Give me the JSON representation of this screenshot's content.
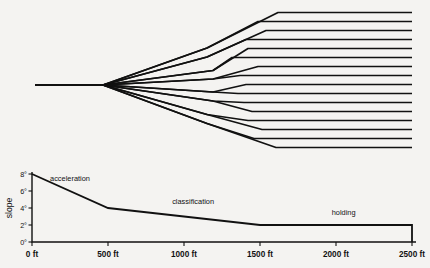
{
  "figure": {
    "background_color": "#f4f3f1",
    "line_color": "#111111"
  },
  "yard_diagram": {
    "name": "classification-yard-fan",
    "description": "Single entry track fanning out through a binary tree of switches into 16 parallel classification tracks",
    "entry_track_count": 1,
    "classification_track_count": 16,
    "switch_levels": 4,
    "stem": {
      "x_start": 35,
      "x_end": 103,
      "y": 85
    },
    "fan_start_x": 103,
    "fan_end_x": 412,
    "tracks": [
      {
        "index": 1,
        "y_end": 12.5,
        "lead_x": 278,
        "parent_y": 48.0,
        "split_x": 207
      },
      {
        "index": 2,
        "y_end": 21.5,
        "lead_x": 258,
        "parent_y": 48.0,
        "split_x": 207
      },
      {
        "index": 3,
        "y_end": 30.5,
        "lead_x": 266,
        "parent_y": 57.0,
        "split_x": 207
      },
      {
        "index": 4,
        "y_end": 39.5,
        "lead_x": 246,
        "parent_y": 57.0,
        "split_x": 207
      },
      {
        "index": 5,
        "y_end": 48.5,
        "lead_x": 248,
        "parent_y": 70.5,
        "split_x": 213
      },
      {
        "index": 6,
        "y_end": 57.5,
        "lead_x": 232,
        "parent_y": 70.5,
        "split_x": 213
      },
      {
        "index": 7,
        "y_end": 66.5,
        "lead_x": 258,
        "parent_y": 79.0,
        "split_x": 213
      },
      {
        "index": 8,
        "y_end": 75.5,
        "lead_x": 240,
        "parent_y": 79.0,
        "split_x": 213
      },
      {
        "index": 9,
        "y_end": 84.5,
        "lead_x": 246,
        "parent_y": 92.0,
        "split_x": 213
      },
      {
        "index": 10,
        "y_end": 93.5,
        "lead_x": 238,
        "parent_y": 92.0,
        "split_x": 213
      },
      {
        "index": 11,
        "y_end": 102.5,
        "lead_x": 244,
        "parent_y": 101.0,
        "split_x": 213
      },
      {
        "index": 12,
        "y_end": 111.5,
        "lead_x": 252,
        "parent_y": 101.0,
        "split_x": 213
      },
      {
        "index": 13,
        "y_end": 120.5,
        "lead_x": 248,
        "parent_y": 114.5,
        "split_x": 207
      },
      {
        "index": 14,
        "y_end": 129.5,
        "lead_x": 262,
        "parent_y": 114.5,
        "split_x": 207
      },
      {
        "index": 15,
        "y_end": 138.5,
        "lead_x": 254,
        "parent_y": 123.5,
        "split_x": 207
      },
      {
        "index": 16,
        "y_end": 147.5,
        "lead_x": 276,
        "parent_y": 123.5,
        "split_x": 207
      }
    ]
  },
  "chart_data": {
    "type": "line",
    "name": "grade-profile",
    "title": "",
    "xlabel": "",
    "ylabel": "slope",
    "x": [
      0,
      500,
      1500,
      2500,
      2500
    ],
    "values": [
      8,
      4,
      2,
      2,
      0
    ],
    "xlim": [
      0,
      2500
    ],
    "ylim": [
      0,
      8
    ],
    "grid": false,
    "legend": "none",
    "x_tick_values": [
      0,
      500,
      1000,
      1500,
      2000,
      2500
    ],
    "x_tick_labels": [
      "0 ft",
      "500 ft",
      "1000 ft",
      "1500 ft",
      "2000 ft",
      "2500 ft"
    ],
    "y_tick_values": [
      0,
      2,
      4,
      6,
      8
    ],
    "y_tick_labels": [
      "0°",
      "2°",
      "4°",
      "6°",
      "8°"
    ],
    "annotations": [
      {
        "label": "acceleration",
        "x": 250,
        "y": 7.2
      },
      {
        "label": "classification",
        "x": 1060,
        "y": 4.5
      },
      {
        "label": "holding",
        "x": 2050,
        "y": 3.2
      }
    ]
  }
}
